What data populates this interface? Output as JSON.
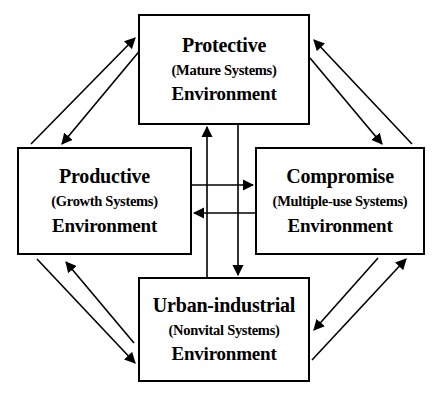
{
  "diagram": {
    "type": "node-link",
    "background_color": "#ffffff",
    "line_color": "#000000",
    "nodes": [
      {
        "id": "protective",
        "title": "Protective",
        "subtitle": "(Mature Systems)",
        "footer": "Environment",
        "position": "top"
      },
      {
        "id": "productive",
        "title": "Productive",
        "subtitle": "(Growth Systems)",
        "footer": "Environment",
        "position": "left"
      },
      {
        "id": "compromise",
        "title": "Compromise",
        "subtitle": "(Multiple-use Systems)",
        "footer": "Environment",
        "position": "right"
      },
      {
        "id": "urban",
        "title": "Urban-industrial",
        "subtitle": "(Nonvital Systems)",
        "footer": "Environment",
        "position": "bottom"
      }
    ],
    "edges": [
      {
        "from": "productive",
        "to": "protective",
        "style": "diagonal"
      },
      {
        "from": "protective",
        "to": "productive",
        "style": "diagonal"
      },
      {
        "from": "compromise",
        "to": "protective",
        "style": "diagonal"
      },
      {
        "from": "protective",
        "to": "compromise",
        "style": "diagonal"
      },
      {
        "from": "productive",
        "to": "urban",
        "style": "diagonal"
      },
      {
        "from": "urban",
        "to": "productive",
        "style": "diagonal"
      },
      {
        "from": "urban",
        "to": "compromise",
        "style": "diagonal"
      },
      {
        "from": "compromise",
        "to": "urban",
        "style": "diagonal"
      },
      {
        "from": "urban",
        "to": "protective",
        "style": "vertical"
      },
      {
        "from": "protective",
        "to": "urban",
        "style": "vertical"
      },
      {
        "from": "productive",
        "to": "compromise",
        "style": "horizontal"
      },
      {
        "from": "compromise",
        "to": "productive",
        "style": "horizontal"
      }
    ]
  }
}
